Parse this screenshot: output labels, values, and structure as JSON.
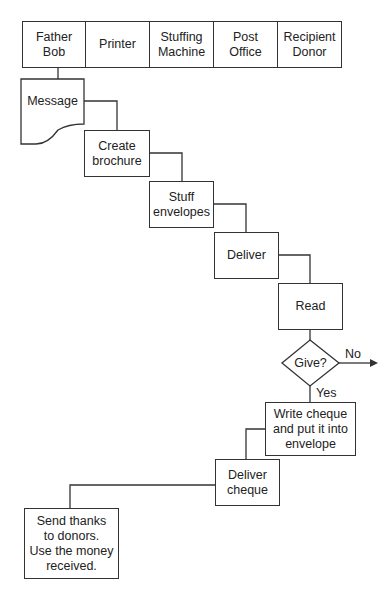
{
  "swimlanes": [
    {
      "label": "Father\nBob"
    },
    {
      "label": "Printer"
    },
    {
      "label": "Stuffing\nMachine"
    },
    {
      "label": "Post\nOffice"
    },
    {
      "label": "Recipient\nDonor"
    }
  ],
  "steps": {
    "message": "Message",
    "create_brochure": "Create\nbrochure",
    "stuff_envelopes": "Stuff\nenvelopes",
    "deliver": "Deliver",
    "read": "Read",
    "decision": "Give?",
    "write_cheque": "Write cheque\nand put it into\nenvelope",
    "deliver_cheque": "Deliver\ncheque",
    "send_thanks": "Send thanks\nto donors.\nUse the money\nreceived."
  },
  "decision_branches": {
    "no": "No",
    "yes": "Yes"
  },
  "colors": {
    "line": "#333333",
    "background": "#ffffff"
  }
}
